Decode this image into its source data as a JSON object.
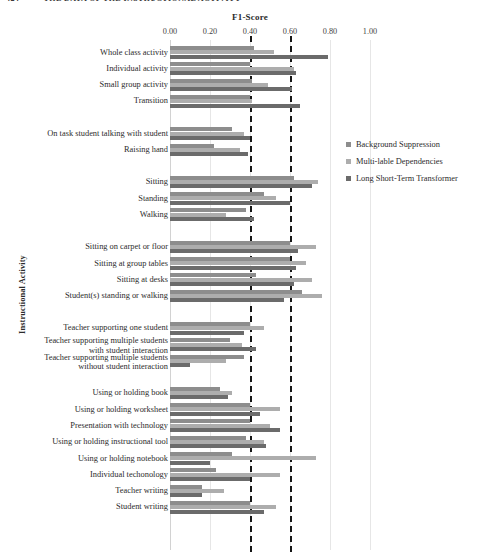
{
  "page_header": {
    "page_number": "424",
    "running_title": "THE DATA OF THE INSTRUCTIONAL ACTIVITY"
  },
  "legend": {
    "position": "right",
    "items": [
      {
        "label": "Background Suppression",
        "color": "#8d8d8d"
      },
      {
        "label": "Multi-lable Dependencies",
        "color": "#adadad"
      },
      {
        "label": "Long Short-Term Transformer",
        "color": "#6b6b6b"
      }
    ]
  },
  "chart_data": {
    "type": "bar",
    "orientation": "horizontal",
    "title": "F1-Score",
    "xlabel": "F1-Score",
    "ylabel": "Instructional Activity",
    "xlim": [
      0.0,
      1.0
    ],
    "xticks": [
      "0.00",
      "0.20",
      "0.40",
      "0.60",
      "0.80",
      "1.00"
    ],
    "xtick_values": [
      0.0,
      0.2,
      0.4,
      0.6,
      0.8,
      1.0
    ],
    "grid": true,
    "reference_lines": [
      0.4,
      0.6
    ],
    "legend_position": "right",
    "series": [
      {
        "name": "Background Suppression",
        "color": "#8d8d8d"
      },
      {
        "name": "Multi-lable Dependencies",
        "color": "#adadad"
      },
      {
        "name": "Long Short-Term Transformer",
        "color": "#6b6b6b"
      }
    ],
    "groups": [
      {
        "name": "group-1",
        "categories": [
          {
            "label": "Whole class activity",
            "values": [
              0.42,
              0.52,
              0.79
            ]
          },
          {
            "label": "Individual activity",
            "values": [
              0.4,
              0.62,
              0.63
            ]
          },
          {
            "label": "Small group activity",
            "values": [
              0.41,
              0.49,
              0.61
            ]
          },
          {
            "label": "Transition",
            "values": [
              0.4,
              0.41,
              0.65
            ]
          }
        ]
      },
      {
        "name": "group-2",
        "categories": [
          {
            "label": "On task student talking with student",
            "values": [
              0.31,
              0.37,
              0.4
            ]
          },
          {
            "label": "Raising hand",
            "values": [
              0.22,
              0.35,
              0.39
            ]
          }
        ]
      },
      {
        "name": "group-3",
        "categories": [
          {
            "label": "Sitting",
            "values": [
              0.62,
              0.74,
              0.71
            ]
          },
          {
            "label": "Standing",
            "values": [
              0.47,
              0.53,
              0.6
            ]
          },
          {
            "label": "Walking",
            "values": [
              0.38,
              0.28,
              0.42
            ]
          }
        ]
      },
      {
        "name": "group-4",
        "categories": [
          {
            "label": "Sitting on carpet or floor",
            "values": [
              0.6,
              0.73,
              0.64
            ]
          },
          {
            "label": "Sitting at group tables",
            "values": [
              0.6,
              0.68,
              0.63
            ]
          },
          {
            "label": "Sitting at desks",
            "values": [
              0.43,
              0.71,
              0.62
            ]
          },
          {
            "label": "Student(s) standing or walking",
            "values": [
              0.66,
              0.76,
              0.57
            ]
          }
        ]
      },
      {
        "name": "group-5",
        "categories": [
          {
            "label": "Teacher supporting one student",
            "values": [
              0.4,
              0.47,
              0.37
            ]
          },
          {
            "label": "Teacher supporting multiple students\nwith student interaction",
            "values": [
              0.3,
              0.36,
              0.43
            ]
          },
          {
            "label": "Teacher supporting multiple students\nwithout student interaction",
            "values": [
              0.37,
              0.28,
              0.1
            ]
          }
        ]
      },
      {
        "name": "group-6",
        "categories": [
          {
            "label": "Using or holding book",
            "values": [
              0.25,
              0.31,
              0.29
            ]
          },
          {
            "label": "Using or holding worksheet",
            "values": [
              0.4,
              0.55,
              0.45
            ]
          },
          {
            "label": "Presentation with technology",
            "values": [
              0.4,
              0.5,
              0.55
            ]
          },
          {
            "label": "Using or holding instructional tool",
            "values": [
              0.38,
              0.47,
              0.48
            ]
          },
          {
            "label": "Using or holding notebook",
            "values": [
              0.31,
              0.73,
              0.2
            ]
          },
          {
            "label": "Individual techonology",
            "values": [
              0.23,
              0.55,
              0.4
            ]
          },
          {
            "label": "Teacher writing",
            "values": [
              0.16,
              0.27,
              0.16
            ]
          },
          {
            "label": "Student writing",
            "values": [
              0.4,
              0.53,
              0.47
            ]
          }
        ]
      }
    ]
  }
}
